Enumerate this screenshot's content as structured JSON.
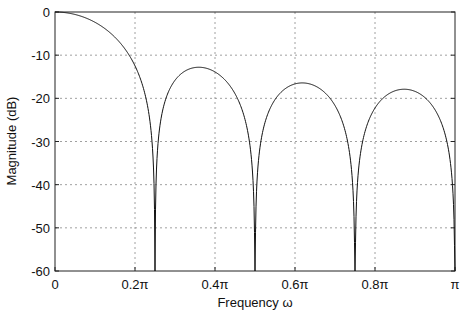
{
  "chart_data": {
    "type": "line",
    "title": "",
    "xlabel": "Frequency ω",
    "ylabel": "Magnitude (dB)",
    "xlim": [
      0,
      1
    ],
    "x_unit": "π rad/sample",
    "ylim": [
      -60,
      0
    ],
    "grid": true,
    "legend": null,
    "xticks": [
      0,
      0.2,
      0.4,
      0.6,
      0.8,
      1.0
    ],
    "xtick_labels": [
      "0",
      "0.2π",
      "0.4π",
      "0.6π",
      "0.8π",
      "π"
    ],
    "yticks": [
      0,
      -10,
      -20,
      -30,
      -40,
      -50,
      -60
    ],
    "ytick_labels": [
      "0",
      "-10",
      "-20",
      "-30",
      "-40",
      "-50",
      "-60"
    ],
    "series": [
      {
        "name": "magnitude response",
        "description": "Length-8 moving-average filter |sin(4ω)/(8 sin(ω/2))| in dB",
        "x": [
          0,
          0.05,
          0.1,
          0.15,
          0.2,
          0.25,
          0.3,
          0.35,
          0.4,
          0.45,
          0.5,
          0.55,
          0.6,
          0.625,
          0.65,
          0.7,
          0.75,
          0.8,
          0.85,
          0.875,
          0.9,
          0.95,
          1.0
        ],
        "values": [
          0,
          -0.9,
          -3.9,
          -9.6,
          -21.0,
          -60,
          -17.0,
          -12.9,
          -14.7,
          -24.0,
          -60,
          -21.5,
          -16.7,
          -16.4,
          -16.7,
          -21.6,
          -60,
          -23.5,
          -18.3,
          -17.9,
          -18.3,
          -24.1,
          -60
        ],
        "nulls_at": [
          0.25,
          0.5,
          0.75,
          1.0
        ],
        "sidelobe_peaks": [
          {
            "x": 0.35,
            "y": -12.8
          },
          {
            "x": 0.625,
            "y": -16.4
          },
          {
            "x": 0.875,
            "y": -17.9
          }
        ],
        "color": "#111111"
      }
    ]
  },
  "colors": {
    "line": "#111111",
    "grid": "#888888",
    "axis": "#222222"
  }
}
